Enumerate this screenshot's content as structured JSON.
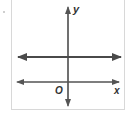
{
  "diagram": {
    "type": "coordinate-plane",
    "axes": {
      "x_label": "x",
      "y_label": "y",
      "origin_label": "O"
    },
    "lines": [
      {
        "name": "horizontal line above x-axis",
        "orientation": "horizontal",
        "relative_position": "above x-axis",
        "style": "thick, arrows both ends"
      }
    ],
    "colors": {
      "axis": "#555555",
      "line": "#4a4a4a",
      "frame": "#d8d8d8"
    }
  }
}
